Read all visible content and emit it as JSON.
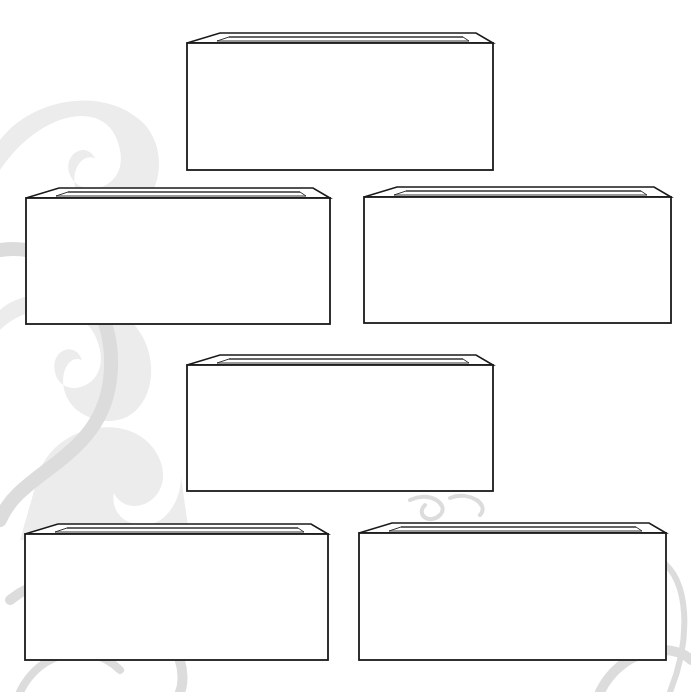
{
  "worksheet": {
    "description": "Blank template with six empty open-top tray boxes arranged in a 1-2-1-2 layout",
    "background_color": "#ffffff",
    "decoration_color": "#dcdcdc",
    "outline_color": "#1a1a1a",
    "boxes": [
      {
        "id": "box-1",
        "x": 187,
        "y": 43,
        "w": 306,
        "h": 127,
        "label": ""
      },
      {
        "id": "box-2",
        "x": 26,
        "y": 198,
        "w": 304,
        "h": 126,
        "label": ""
      },
      {
        "id": "box-3",
        "x": 364,
        "y": 197,
        "w": 307,
        "h": 126,
        "label": ""
      },
      {
        "id": "box-4",
        "x": 187,
        "y": 365,
        "w": 306,
        "h": 126,
        "label": ""
      },
      {
        "id": "box-5",
        "x": 25,
        "y": 534,
        "w": 303,
        "h": 126,
        "label": ""
      },
      {
        "id": "box-6",
        "x": 359,
        "y": 533,
        "w": 307,
        "h": 127,
        "label": ""
      }
    ]
  }
}
